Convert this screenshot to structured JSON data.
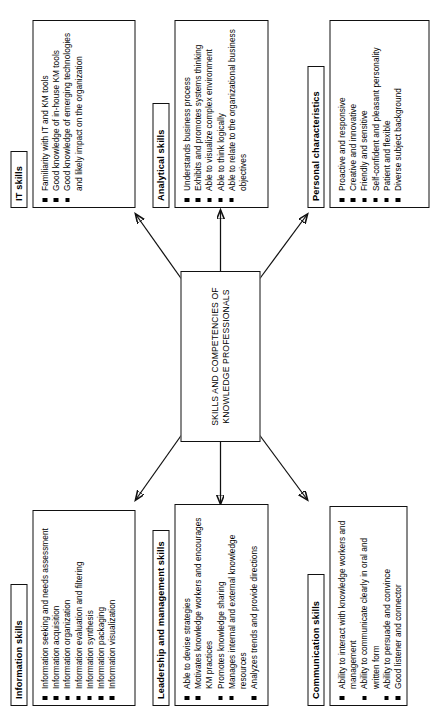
{
  "diagram": {
    "type": "hub-and-spoke",
    "orientation": "rotated-90-ccw",
    "center": {
      "label": "SKILLS AND COMPETENCIES OF KNOWLEDGE PROFESSIONALS"
    },
    "boxes": [
      {
        "id": "information-skills",
        "title": "Information skills",
        "items": [
          "Information seeking and needs assessment",
          "Information acquisition",
          "Information organization",
          "Information evaluation and filtering",
          "Information synthesis",
          "Information packaging",
          "Information visualization"
        ]
      },
      {
        "id": "leadership-and-management-skills",
        "title": "Leadership and management skills",
        "items": [
          "Able to devise strategies",
          "Motivates knowledge workers and encourages KM practices",
          "Promotes knowledge sharing",
          "Manages internal and external knowledge resources",
          "Analyzes trends and provide directions"
        ]
      },
      {
        "id": "it-skills",
        "title": "IT skills",
        "items": [
          "Familiarity with IT and KM tools",
          "Good knowledge of in-house KM tools",
          "Good knowledge of emerging technologies and likely impact on the organization"
        ]
      },
      {
        "id": "communication-skills",
        "title": "Communication skills",
        "items": [
          "Ability to interact with knowledge workers and management",
          "Ability to communicate clearly in oral and written form",
          "Ability to persuade and convince",
          "Good listener and connector"
        ]
      },
      {
        "id": "analytical-skills",
        "title": "Analytical  skills",
        "items": [
          "Understands business process",
          "Exhibits and promotes systems thinking",
          "Able to visualize complex environment",
          "Able to think logically",
          "Able to relate to the organizational business objectives"
        ]
      },
      {
        "id": "personal-characteristics",
        "title": "Personal characteristics",
        "items": [
          "Proactive and responsive",
          "Creative and innovative",
          "Friendly and sensitive",
          "Self-confident and pleasant personality",
          "Patient and flexible",
          "Diverse subject background"
        ]
      }
    ],
    "colors": {
      "stroke": "#111111",
      "background": "#ffffff",
      "bullet": "#000000"
    }
  }
}
